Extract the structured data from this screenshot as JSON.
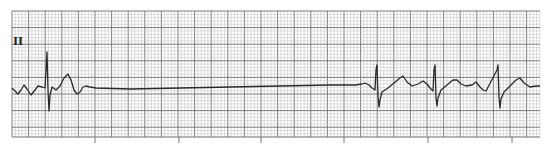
{
  "ecg": {
    "lead_label": "II",
    "grid": {
      "x0": 12,
      "y0": 11,
      "x1": 540,
      "y1": 137,
      "major_px": 16.6,
      "minor_px": 3.32,
      "minor_color": "#bdbdbd",
      "major_color": "#6e6e6e",
      "background": "#ffffff"
    },
    "time_ticks_x": [
      95,
      179,
      261,
      344,
      428,
      512
    ],
    "trace_color": "#2a2a2a",
    "trace_points": [
      [
        12,
        88
      ],
      [
        15,
        91
      ],
      [
        18,
        94
      ],
      [
        21,
        90
      ],
      [
        24,
        85
      ],
      [
        27,
        89
      ],
      [
        31,
        95
      ],
      [
        35,
        90
      ],
      [
        38,
        86
      ],
      [
        42,
        87
      ],
      [
        45,
        88
      ],
      [
        46,
        70
      ],
      [
        47,
        52
      ],
      [
        48,
        90
      ],
      [
        49,
        111
      ],
      [
        50,
        95
      ],
      [
        52,
        87
      ],
      [
        56,
        90
      ],
      [
        60,
        86
      ],
      [
        64,
        78
      ],
      [
        68,
        74
      ],
      [
        71,
        80
      ],
      [
        74,
        90
      ],
      [
        77,
        94
      ],
      [
        80,
        92
      ],
      [
        83,
        87
      ],
      [
        86,
        86
      ],
      [
        90,
        87
      ],
      [
        96,
        88
      ],
      [
        130,
        89
      ],
      [
        180,
        88
      ],
      [
        230,
        87
      ],
      [
        280,
        86
      ],
      [
        330,
        85
      ],
      [
        355,
        85
      ],
      [
        362,
        84
      ],
      [
        365,
        83
      ],
      [
        369,
        85
      ],
      [
        372,
        88
      ],
      [
        375,
        90
      ],
      [
        376,
        70
      ],
      [
        377,
        65
      ],
      [
        378,
        96
      ],
      [
        379,
        107
      ],
      [
        380,
        100
      ],
      [
        382,
        92
      ],
      [
        388,
        88
      ],
      [
        394,
        83
      ],
      [
        400,
        78
      ],
      [
        403,
        76
      ],
      [
        407,
        82
      ],
      [
        412,
        86
      ],
      [
        418,
        84
      ],
      [
        423,
        81
      ],
      [
        427,
        84
      ],
      [
        430,
        88
      ],
      [
        433,
        91
      ],
      [
        434,
        70
      ],
      [
        435,
        65
      ],
      [
        436,
        98
      ],
      [
        437,
        106
      ],
      [
        438,
        98
      ],
      [
        441,
        90
      ],
      [
        447,
        85
      ],
      [
        453,
        80
      ],
      [
        457,
        80
      ],
      [
        461,
        84
      ],
      [
        466,
        86
      ],
      [
        472,
        85
      ],
      [
        476,
        82
      ],
      [
        480,
        87
      ],
      [
        483,
        90
      ],
      [
        486,
        91
      ],
      [
        497,
        70
      ],
      [
        498,
        65
      ],
      [
        499,
        97
      ],
      [
        500,
        108
      ],
      [
        501,
        99
      ],
      [
        504,
        92
      ],
      [
        510,
        86
      ],
      [
        516,
        80
      ],
      [
        520,
        78
      ],
      [
        524,
        83
      ],
      [
        530,
        87
      ],
      [
        536,
        86
      ],
      [
        540,
        86
      ]
    ]
  }
}
